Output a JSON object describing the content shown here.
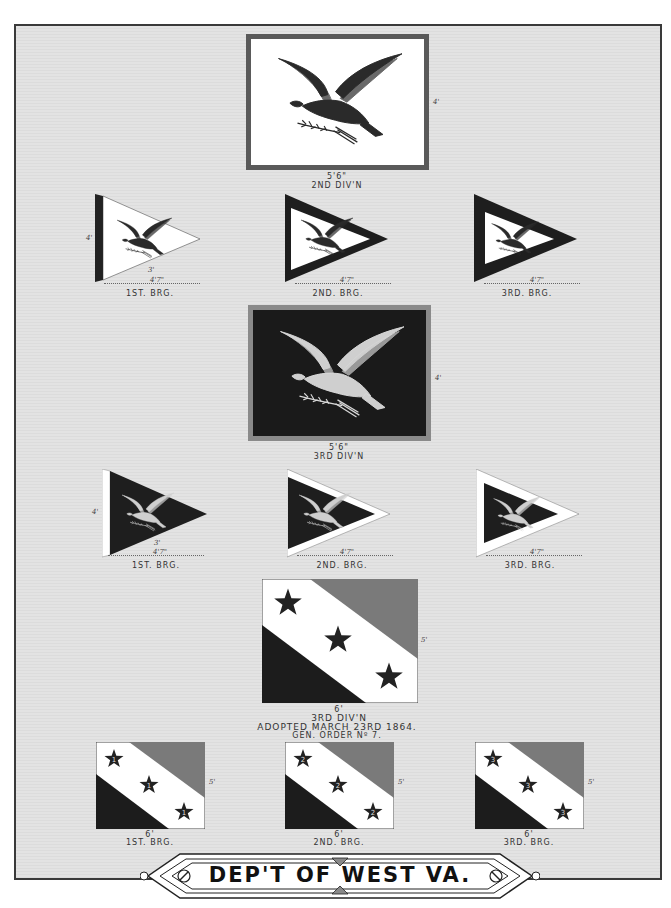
{
  "page": {
    "title": "DEP'T OF WEST VA.",
    "colors": {
      "background": "#e0e0e0",
      "dark": "#1c1c1c",
      "gray_stripe": "#7a7a7a",
      "white": "#ffffff",
      "border": "#3a3a3a"
    }
  },
  "flags": {
    "eagle_white_div": {
      "width_label": "5'6\"",
      "height_label": "4'",
      "caption": "2ND DIV'N"
    },
    "eagle_white_pennants": [
      {
        "caption": "1ST. BRG.",
        "length_label": "4'7\"",
        "hoist_label": "3'",
        "side_label": "4'"
      },
      {
        "caption": "2ND. BRG.",
        "length_label": "4'7\""
      },
      {
        "caption": "3RD. BRG.",
        "length_label": "4'7\""
      }
    ],
    "eagle_dark_div": {
      "width_label": "5'6\"",
      "height_label": "4'",
      "caption": "3RD DIV'N"
    },
    "eagle_dark_pennants": [
      {
        "caption": "1ST. BRG.",
        "length_label": "4'7\"",
        "hoist_label": "3'",
        "side_label": "4'"
      },
      {
        "caption": "2ND. BRG.",
        "length_label": "4'7\""
      },
      {
        "caption": "3RD. BRG.",
        "length_label": "4'7\""
      }
    ],
    "star_div": {
      "width_label": "6'",
      "height_label": "5'",
      "caption": "3RD DIV'N",
      "adopted": "ADOPTED MARCH 23RD 1864.",
      "order": "GEN. ORDER Nº 7."
    },
    "star_brigades": [
      {
        "caption": "1ST. BRG.",
        "width_label": "6'",
        "height_label": "5'",
        "star_number": "1"
      },
      {
        "caption": "2ND. BRG.",
        "width_label": "6'",
        "height_label": "5'",
        "star_number": "2"
      },
      {
        "caption": "3RD. BRG.",
        "width_label": "6'",
        "height_label": "5'",
        "star_number": "3"
      }
    ]
  }
}
